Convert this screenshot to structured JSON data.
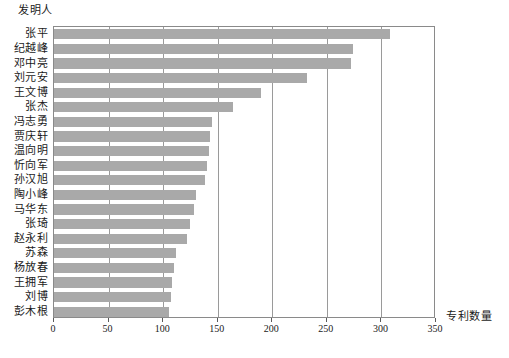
{
  "chart_data": {
    "type": "bar",
    "orientation": "horizontal",
    "title": "",
    "xlabel": "专利数量",
    "ylabel": "发明人",
    "xlim": [
      0,
      350
    ],
    "xticks": [
      0,
      50,
      100,
      150,
      200,
      250,
      300,
      350
    ],
    "grid": true,
    "legend": null,
    "bar_color": "#a9a9a9",
    "axis_color": "#8a8a8a",
    "categories": [
      "张平",
      "纪越峰",
      "邓中亮",
      "刘元安",
      "王文博",
      "张杰",
      "冯志勇",
      "贾庆轩",
      "温向明",
      "忻向军",
      "孙汉旭",
      "陶小峰",
      "马华东",
      "张琦",
      "赵永利",
      "苏森",
      "杨放春",
      "王拥军",
      "刘博",
      "彭木根"
    ],
    "values": [
      308,
      274,
      272,
      232,
      190,
      164,
      145,
      143,
      142,
      140,
      138,
      130,
      128,
      125,
      122,
      112,
      110,
      108,
      107,
      105
    ]
  }
}
